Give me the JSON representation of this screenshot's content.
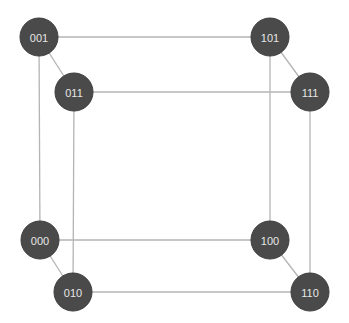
{
  "diagram": {
    "node_radius": 19,
    "colors": {
      "node_fill": "#4a4a4a",
      "node_text": "#e6e6e6",
      "edge": "#b4b4b4",
      "background": "#ffffff"
    },
    "nodes": [
      {
        "id": "001",
        "label": "001",
        "x": 39,
        "y": 37
      },
      {
        "id": "101",
        "label": "101",
        "x": 270,
        "y": 37
      },
      {
        "id": "011",
        "label": "011",
        "x": 74,
        "y": 92
      },
      {
        "id": "111",
        "label": "111",
        "x": 310,
        "y": 92
      },
      {
        "id": "000",
        "label": "000",
        "x": 40,
        "y": 240
      },
      {
        "id": "100",
        "label": "100",
        "x": 270,
        "y": 240
      },
      {
        "id": "010",
        "label": "010",
        "x": 73,
        "y": 292
      },
      {
        "id": "110",
        "label": "110",
        "x": 310,
        "y": 292
      }
    ],
    "edges": [
      [
        "001",
        "101"
      ],
      [
        "001",
        "011"
      ],
      [
        "001",
        "000"
      ],
      [
        "101",
        "111"
      ],
      [
        "101",
        "100"
      ],
      [
        "011",
        "111"
      ],
      [
        "011",
        "010"
      ],
      [
        "111",
        "110"
      ],
      [
        "000",
        "100"
      ],
      [
        "000",
        "010"
      ],
      [
        "100",
        "110"
      ],
      [
        "010",
        "110"
      ]
    ]
  }
}
